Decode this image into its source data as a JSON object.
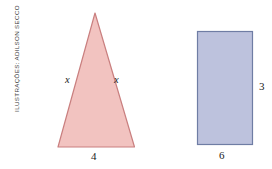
{
  "illustration": {
    "credit": "ILUSTRAÇÕES: ADILSON SECCO",
    "background_color": "#ffffff"
  },
  "shapes": [
    {
      "name": "triangle",
      "kind": "isosceles-triangle",
      "fill_color": "#f2c3c0",
      "stroke_color": "#c97f7f",
      "labels": {
        "base": "4",
        "left_side": "x",
        "right_side": "x"
      }
    },
    {
      "name": "rectangle",
      "kind": "rectangle",
      "fill_color": "#bdc2dd",
      "stroke_color": "#6f7da4",
      "labels": {
        "height": "3",
        "width": "6"
      }
    }
  ],
  "triangle": {
    "base_label": "4",
    "left_side_label": "x",
    "right_side_label": "x",
    "fill_color": "#f2c3c0",
    "stroke_color": "#c97f7f"
  },
  "rectangle": {
    "height_label": "3",
    "width_label": "6",
    "fill_color": "#bdc2dd",
    "stroke_color": "#6f7da4"
  }
}
